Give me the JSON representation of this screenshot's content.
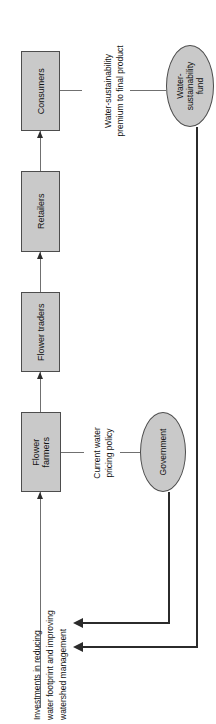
{
  "diagram": {
    "orientation": "rotated-90-ccw",
    "colors": {
      "node_fill": "#c9c9c9",
      "node_stroke": "#4d4d4d",
      "chain_line": "#707070",
      "feedback_line": "#2b2b2b",
      "text": "#111111",
      "background": "#ffffff"
    },
    "nodes": [
      {
        "id": "consumers",
        "shape": "box",
        "label": "Consumers"
      },
      {
        "id": "retailers",
        "shape": "box",
        "label": "Retailers"
      },
      {
        "id": "flower-traders",
        "shape": "box",
        "label": "Flower traders"
      },
      {
        "id": "flower-farmers",
        "shape": "box",
        "label_line1": "Flower",
        "label_line2": "farmers"
      },
      {
        "id": "government",
        "shape": "ellipse",
        "label": "Government"
      },
      {
        "id": "water-fund",
        "shape": "ellipse",
        "label_line1": "Water-",
        "label_line2": "sustainability",
        "label_line3": "fund"
      }
    ],
    "edge_labels": {
      "premium_line1": "Water-sustainability",
      "premium_line2": "premium to final product",
      "pricing_line1": "Current water",
      "pricing_line2": "pricing policy",
      "investments_line1": "Investments in reducing",
      "investments_line2": "water footprint and improving",
      "investments_line3": "watershed management"
    }
  }
}
